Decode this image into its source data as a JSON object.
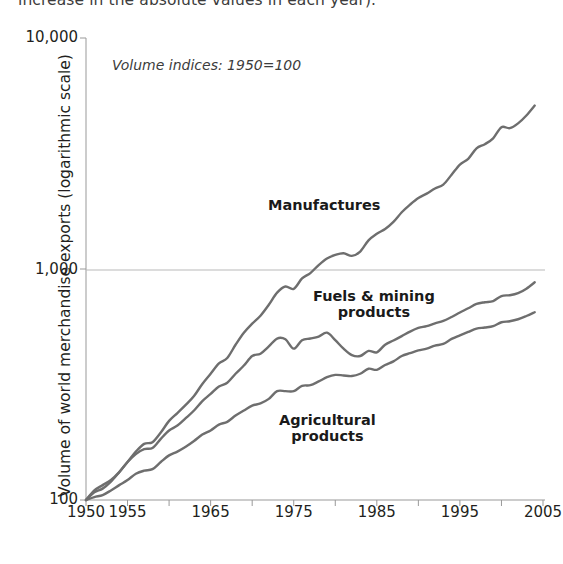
{
  "caption": {
    "text": "increase in the absolute values in each year)."
  },
  "chart_data": {
    "type": "line",
    "title": "",
    "annotation": "Volume indices: 1950=100",
    "xlabel": "",
    "ylabel": "Volume of world merchandise exports (logarithmic scale)",
    "y_scale": "log",
    "ylim": [
      100,
      10000
    ],
    "ytick_labels": [
      "10,000",
      "1,000",
      "100"
    ],
    "ytick_values": [
      10000,
      1000,
      100
    ],
    "xlim": [
      1950,
      2005
    ],
    "xtick_labels": [
      "1950",
      "1955",
      "1965",
      "1975",
      "1985",
      "1995",
      "2005"
    ],
    "xtick_values": [
      1950,
      1955,
      1965,
      1975,
      1985,
      1995,
      2005
    ],
    "x_minor_tick_interval": 5,
    "grid": "horizontal gridline at 1,000 only",
    "legend": "inline series labels",
    "line_color": "#6e6e6e",
    "x": [
      1950,
      1951,
      1952,
      1953,
      1954,
      1955,
      1956,
      1957,
      1958,
      1959,
      1960,
      1961,
      1962,
      1963,
      1964,
      1965,
      1966,
      1967,
      1968,
      1969,
      1970,
      1971,
      1972,
      1973,
      1974,
      1975,
      1976,
      1977,
      1978,
      1979,
      1980,
      1981,
      1982,
      1983,
      1984,
      1985,
      1986,
      1987,
      1988,
      1989,
      1990,
      1991,
      1992,
      1993,
      1994,
      1995,
      1996,
      1997,
      1998,
      1999,
      2000,
      2001,
      2002,
      2003,
      2004
    ],
    "series": [
      {
        "name": "Manufactures",
        "label": "Manufactures",
        "values": [
          100,
          108,
          112,
          120,
          132,
          146,
          162,
          175,
          178,
          196,
          220,
          238,
          258,
          282,
          318,
          352,
          390,
          412,
          470,
          530,
          580,
          628,
          700,
          790,
          840,
          820,
          910,
          960,
          1040,
          1110,
          1150,
          1170,
          1140,
          1190,
          1330,
          1420,
          1490,
          1600,
          1760,
          1900,
          2030,
          2120,
          2230,
          2320,
          2560,
          2830,
          3000,
          3330,
          3470,
          3680,
          4110,
          4070,
          4270,
          4620,
          5100
        ]
      },
      {
        "name": "Fuels & mining products",
        "label": "Fuels & mining\nproducts",
        "values": [
          100,
          110,
          116,
          122,
          132,
          146,
          158,
          166,
          168,
          184,
          200,
          210,
          226,
          244,
          268,
          288,
          310,
          322,
          352,
          382,
          420,
          430,
          462,
          500,
          496,
          452,
          492,
          500,
          510,
          530,
          492,
          452,
          424,
          420,
          442,
          436,
          470,
          490,
          512,
          536,
          556,
          566,
          582,
          596,
          620,
          648,
          676,
          706,
          718,
          726,
          764,
          770,
          786,
          822,
          876
        ]
      },
      {
        "name": "Agricultural products",
        "label": "Agricultural\nproducts",
        "values": [
          100,
          103,
          105,
          110,
          116,
          122,
          130,
          134,
          136,
          146,
          156,
          162,
          170,
          180,
          192,
          200,
          212,
          218,
          232,
          244,
          256,
          262,
          274,
          296,
          296,
          296,
          312,
          314,
          326,
          340,
          348,
          346,
          344,
          352,
          370,
          366,
          384,
          398,
          420,
          432,
          444,
          452,
          466,
          474,
          498,
          516,
          534,
          552,
          558,
          566,
          588,
          594,
          606,
          626,
          650
        ]
      }
    ]
  }
}
